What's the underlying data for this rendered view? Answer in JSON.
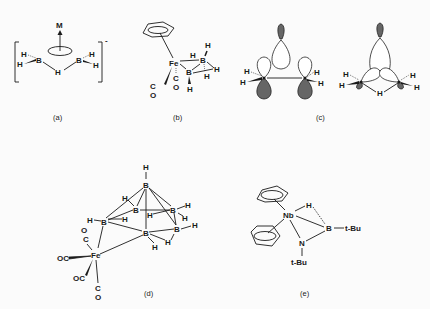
{
  "figure": {
    "panels": [
      {
        "id": "a",
        "caption": "(a)",
        "atoms": {
          "metal": "M",
          "boron": "B",
          "hydrogen": "H"
        },
        "charge": "-"
      },
      {
        "id": "b",
        "caption": "(b)",
        "atoms": {
          "iron": "Fe",
          "boron": "B",
          "hydrogen": "H",
          "carbon": "C",
          "oxygen": "O"
        }
      },
      {
        "id": "c",
        "caption": "(c)",
        "atoms": {
          "boron": "B",
          "hydrogen": "H"
        }
      },
      {
        "id": "d",
        "caption": "(d)",
        "atoms": {
          "iron": "Fe",
          "boron": "B",
          "hydrogen": "H",
          "carbon": "C",
          "oxygen": "O",
          "carbonyl": "OC"
        }
      },
      {
        "id": "e",
        "caption": "(e)",
        "atoms": {
          "niobium": "Nb",
          "boron": "B",
          "nitrogen": "N",
          "hydrogen": "H",
          "tbutyl": "t-Bu"
        }
      }
    ]
  }
}
